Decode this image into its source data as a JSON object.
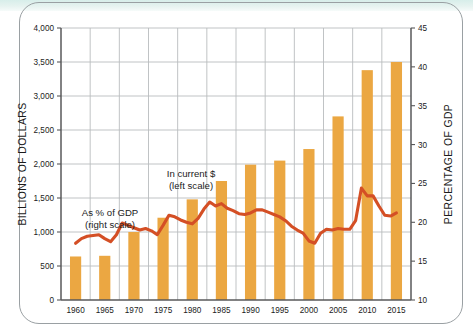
{
  "chart_data": {
    "type": "bar",
    "title": "",
    "subtitle": "",
    "xlabel": "",
    "ylabel": "BILLIONS OF DOLLARS",
    "y2label": "PERCENTAGE OF GDP",
    "categories": [
      "1960",
      "1965",
      "1970",
      "1975",
      "1980",
      "1985",
      "1990",
      "1995",
      "2000",
      "2005",
      "2010",
      "2015"
    ],
    "ylim": [
      0,
      4000
    ],
    "ytick_labels": [
      "0",
      "500",
      "1,000",
      "1,500",
      "2,000",
      "2,500",
      "3,000",
      "3,500",
      "4,000"
    ],
    "ytick_values": [
      0,
      500,
      1000,
      1500,
      2000,
      2500,
      3000,
      3500,
      4000
    ],
    "y2lim": [
      10,
      45
    ],
    "y2tick_labels": [
      "10",
      "15",
      "20",
      "25",
      "30",
      "35",
      "40",
      "45"
    ],
    "y2tick_values": [
      10,
      15,
      20,
      25,
      30,
      35,
      40,
      45
    ],
    "grid": true,
    "legend_position": "inline-annotations",
    "bar_color": "#eba742",
    "line_color": "#d44f25",
    "series": [
      {
        "name": "In current $",
        "axis": "left",
        "type": "bar",
        "units": "billions of dollars",
        "values": [
          640,
          650,
          1000,
          1210,
          1480,
          1750,
          1990,
          2050,
          2220,
          2700,
          3380,
          3500
        ]
      },
      {
        "name": "As % of GDP",
        "axis": "right",
        "type": "line",
        "units": "percentage of GDP",
        "x": [
          1960,
          1961,
          1962,
          1963,
          1964,
          1965,
          1966,
          1967,
          1968,
          1969,
          1970,
          1971,
          1972,
          1973,
          1974,
          1975,
          1976,
          1977,
          1978,
          1979,
          1980,
          1981,
          1982,
          1983,
          1984,
          1985,
          1986,
          1987,
          1988,
          1989,
          1990,
          1991,
          1992,
          1993,
          1994,
          1995,
          1996,
          1997,
          1998,
          1999,
          2000,
          2001,
          2002,
          2003,
          2004,
          2005,
          2006,
          2007,
          2008,
          2009,
          2010,
          2011,
          2012,
          2013,
          2014,
          2015
        ],
        "values": [
          17.3,
          17.9,
          18.2,
          18.3,
          18.4,
          17.9,
          17.5,
          18.4,
          19.9,
          19.6,
          19.3,
          19.0,
          19.2,
          18.9,
          18.4,
          19.6,
          20.9,
          20.7,
          20.3,
          20.0,
          19.8,
          20.5,
          21.7,
          22.6,
          22.1,
          22.4,
          21.8,
          21.5,
          21.1,
          21.0,
          21.2,
          21.6,
          21.6,
          21.3,
          21.0,
          20.7,
          20.2,
          19.5,
          19.0,
          18.6,
          17.6,
          17.3,
          18.6,
          19.1,
          19.0,
          19.2,
          19.1,
          19.1,
          20.2,
          24.4,
          23.4,
          23.4,
          22.1,
          20.9,
          20.8,
          21.2
        ]
      }
    ],
    "annotations": [
      {
        "id": "bars-annotation",
        "line1": "In current $",
        "line2": "(left scale)"
      },
      {
        "id": "line-annotation",
        "line1": "As % of GDP",
        "line2": "(right scale)"
      }
    ]
  }
}
